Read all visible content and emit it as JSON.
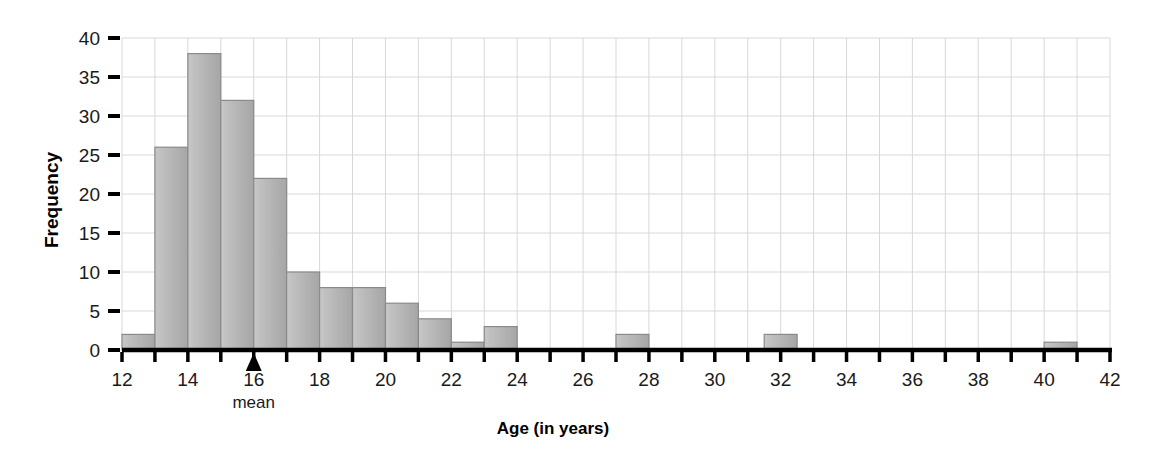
{
  "chart_data": {
    "type": "bar",
    "title": "",
    "subtitle": "",
    "xlabel": "Age (in years)",
    "ylabel": "Frequency",
    "xlim": [
      12,
      42
    ],
    "ylim": [
      0,
      40
    ],
    "grid": true,
    "legend": null,
    "bin_width": 1,
    "x_tick_step": 2,
    "y_tick_step": 5,
    "x_ticks": [
      12,
      13,
      14,
      15,
      16,
      17,
      18,
      19,
      20,
      21,
      22,
      23,
      24,
      25,
      26,
      27,
      28,
      29,
      30,
      31,
      32,
      33,
      34,
      35,
      36,
      37,
      38,
      39,
      40,
      41,
      42
    ],
    "x_tick_labels": [
      "12",
      "",
      "14",
      "",
      "16",
      "",
      "18",
      "",
      "20",
      "",
      "22",
      "",
      "24",
      "",
      "26",
      "",
      "28",
      "",
      "30",
      "",
      "32",
      "",
      "34",
      "",
      "36",
      "",
      "38",
      "",
      "40",
      "",
      "42"
    ],
    "y_ticks": [
      0,
      5,
      10,
      15,
      20,
      25,
      30,
      35,
      40
    ],
    "y_tick_labels": [
      "0",
      "5",
      "10",
      "15",
      "20",
      "25",
      "30",
      "35",
      "40"
    ],
    "bars": [
      {
        "bin_start": 12,
        "bin_end": 13,
        "value": 2
      },
      {
        "bin_start": 13,
        "bin_end": 14,
        "value": 26
      },
      {
        "bin_start": 14,
        "bin_end": 15,
        "value": 38
      },
      {
        "bin_start": 15,
        "bin_end": 16,
        "value": 32
      },
      {
        "bin_start": 16,
        "bin_end": 17,
        "value": 22
      },
      {
        "bin_start": 17,
        "bin_end": 18,
        "value": 10
      },
      {
        "bin_start": 18,
        "bin_end": 19,
        "value": 8
      },
      {
        "bin_start": 19,
        "bin_end": 20,
        "value": 8
      },
      {
        "bin_start": 20,
        "bin_end": 21,
        "value": 6
      },
      {
        "bin_start": 21,
        "bin_end": 22,
        "value": 4
      },
      {
        "bin_start": 22,
        "bin_end": 23,
        "value": 1
      },
      {
        "bin_start": 23,
        "bin_end": 24,
        "value": 3
      },
      {
        "bin_start": 27,
        "bin_end": 28,
        "value": 2
      },
      {
        "bin_start": 31.5,
        "bin_end": 32.5,
        "value": 2
      },
      {
        "bin_start": 40,
        "bin_end": 41,
        "value": 1
      }
    ],
    "annotations": [
      {
        "name": "mean-marker",
        "label": "mean",
        "x_value": 16,
        "marker": "up-triangle"
      }
    ],
    "colors": {
      "bar_fill_light": "#c3c3c3",
      "bar_fill_dark": "#a8a8a8",
      "bar_edge": "#8a8a8a",
      "grid": "#d8d8d8",
      "axis": "#000000",
      "text": "#1a1a1a"
    }
  }
}
